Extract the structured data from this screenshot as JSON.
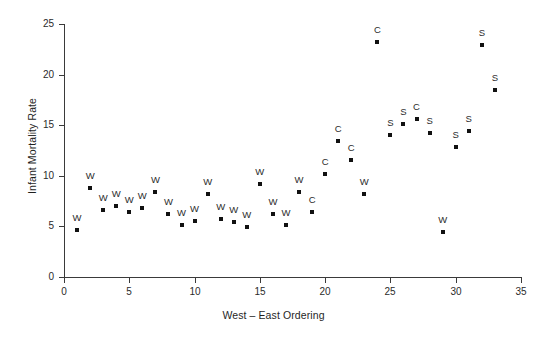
{
  "chart_data": {
    "type": "scatter",
    "title": "",
    "xlabel": "West – East Ordering",
    "ylabel": "Infant Mortality Rate",
    "xlim": [
      0,
      35
    ],
    "ylim": [
      0,
      25
    ],
    "xticks": [
      0,
      5,
      10,
      15,
      20,
      25,
      30,
      35
    ],
    "yticks": [
      0,
      5,
      10,
      15,
      20,
      25
    ],
    "grid": false,
    "legend": "none",
    "marker_style": "filled-square",
    "marker_color": "#111111",
    "point_label_note": "Each point is annotated above with a one-letter region code: W, C or S",
    "points": [
      {
        "x": 1,
        "y": 4.6,
        "label": "W"
      },
      {
        "x": 2,
        "y": 8.8,
        "label": "W"
      },
      {
        "x": 3,
        "y": 6.6,
        "label": "W"
      },
      {
        "x": 4,
        "y": 7.0,
        "label": "W"
      },
      {
        "x": 5,
        "y": 6.4,
        "label": "W"
      },
      {
        "x": 6,
        "y": 6.8,
        "label": "W"
      },
      {
        "x": 7,
        "y": 8.4,
        "label": "W"
      },
      {
        "x": 8,
        "y": 6.2,
        "label": "W"
      },
      {
        "x": 9,
        "y": 5.1,
        "label": "W"
      },
      {
        "x": 10,
        "y": 5.5,
        "label": "W"
      },
      {
        "x": 11,
        "y": 8.2,
        "label": "W"
      },
      {
        "x": 12,
        "y": 5.7,
        "label": "W"
      },
      {
        "x": 13,
        "y": 5.4,
        "label": "W"
      },
      {
        "x": 14,
        "y": 4.9,
        "label": "W"
      },
      {
        "x": 15,
        "y": 9.2,
        "label": "W"
      },
      {
        "x": 16,
        "y": 6.2,
        "label": "W"
      },
      {
        "x": 17,
        "y": 5.1,
        "label": "W"
      },
      {
        "x": 18,
        "y": 8.4,
        "label": "W"
      },
      {
        "x": 19,
        "y": 6.4,
        "label": "C"
      },
      {
        "x": 20,
        "y": 10.2,
        "label": "C"
      },
      {
        "x": 21,
        "y": 13.4,
        "label": "C"
      },
      {
        "x": 22,
        "y": 11.6,
        "label": "C"
      },
      {
        "x": 23,
        "y": 8.2,
        "label": "W"
      },
      {
        "x": 24,
        "y": 23.2,
        "label": "C"
      },
      {
        "x": 25,
        "y": 14.0,
        "label": "S"
      },
      {
        "x": 26,
        "y": 15.1,
        "label": "S"
      },
      {
        "x": 27,
        "y": 15.6,
        "label": "C"
      },
      {
        "x": 28,
        "y": 14.2,
        "label": "S"
      },
      {
        "x": 29,
        "y": 4.4,
        "label": "W"
      },
      {
        "x": 30,
        "y": 12.8,
        "label": "S"
      },
      {
        "x": 31,
        "y": 14.4,
        "label": "S"
      },
      {
        "x": 32,
        "y": 22.9,
        "label": "S"
      },
      {
        "x": 33,
        "y": 18.5,
        "label": "S"
      }
    ]
  }
}
